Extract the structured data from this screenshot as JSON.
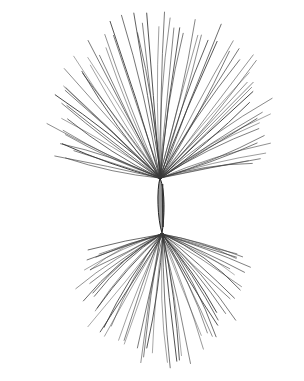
{
  "image": {
    "subject": "seed-with-pappus-hairs",
    "style": "black-and-white line engraving",
    "background": "#ffffff",
    "ink": "#3a3a3a"
  },
  "seed": {
    "top": [
      160,
      178
    ],
    "bottom": [
      162,
      233
    ],
    "width": 7
  },
  "upper_tuft": {
    "origin": [
      160,
      178
    ],
    "count": 70,
    "angle_start": -168,
    "angle_end": -8,
    "length_min": 95,
    "length_max": 160
  },
  "lower_tuft": {
    "origin": [
      162,
      234
    ],
    "count": 55,
    "angle_start": 12,
    "angle_end": 168,
    "length_min": 70,
    "length_max": 125
  }
}
